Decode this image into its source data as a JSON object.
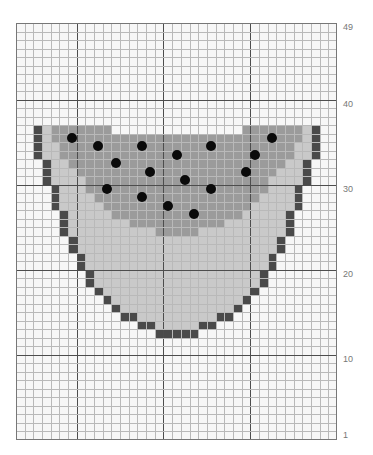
{
  "grid": {
    "columns": 37,
    "rows": 49,
    "major_every_col_offset": 7,
    "major_every": 10,
    "colors": {
      "background": "#f7f7f7",
      "light": "#c9c9c9",
      "medium": "#9b9b9b",
      "dark": "#4a4a4a",
      "dot": "#0a0a0a"
    }
  },
  "row_labels": [
    {
      "row": 49,
      "label": "49"
    },
    {
      "row": 40,
      "label": "40"
    },
    {
      "row": 30,
      "label": "30"
    },
    {
      "row": 20,
      "label": "20"
    },
    {
      "row": 10,
      "label": "10"
    },
    {
      "row": 1,
      "label": "1"
    }
  ],
  "pattern": [
    {
      "row": 37,
      "spans": [
        [
          "dark",
          2,
          2
        ],
        [
          "light",
          3,
          3
        ],
        [
          "medium",
          4,
          10
        ],
        [
          "medium",
          26,
          32
        ],
        [
          "light",
          33,
          33
        ],
        [
          "dark",
          34,
          34
        ]
      ]
    },
    {
      "row": 36,
      "spans": [
        [
          "dark",
          2,
          2
        ],
        [
          "light",
          3,
          3
        ],
        [
          "medium",
          4,
          32
        ],
        [
          "light",
          33,
          33
        ],
        [
          "dark",
          34,
          34
        ]
      ]
    },
    {
      "row": 35,
      "spans": [
        [
          "dark",
          2,
          2
        ],
        [
          "light",
          3,
          4
        ],
        [
          "medium",
          5,
          31
        ],
        [
          "light",
          32,
          33
        ],
        [
          "dark",
          34,
          34
        ]
      ]
    },
    {
      "row": 34,
      "spans": [
        [
          "dark",
          2,
          2
        ],
        [
          "light",
          3,
          4
        ],
        [
          "medium",
          5,
          31
        ],
        [
          "light",
          32,
          33
        ],
        [
          "dark",
          34,
          34
        ]
      ]
    },
    {
      "row": 33,
      "spans": [
        [
          "dark",
          3,
          3
        ],
        [
          "light",
          4,
          5
        ],
        [
          "medium",
          6,
          30
        ],
        [
          "light",
          31,
          32
        ],
        [
          "dark",
          33,
          33
        ]
      ]
    },
    {
      "row": 32,
      "spans": [
        [
          "dark",
          3,
          3
        ],
        [
          "light",
          4,
          6
        ],
        [
          "medium",
          7,
          29
        ],
        [
          "light",
          30,
          32
        ],
        [
          "dark",
          33,
          33
        ]
      ]
    },
    {
      "row": 31,
      "spans": [
        [
          "dark",
          3,
          3
        ],
        [
          "light",
          4,
          7
        ],
        [
          "medium",
          8,
          28
        ],
        [
          "light",
          29,
          32
        ],
        [
          "dark",
          33,
          33
        ]
      ]
    },
    {
      "row": 30,
      "spans": [
        [
          "dark",
          4,
          4
        ],
        [
          "light",
          5,
          7
        ],
        [
          "medium",
          8,
          28
        ],
        [
          "light",
          29,
          31
        ],
        [
          "dark",
          32,
          32
        ]
      ]
    },
    {
      "row": 29,
      "spans": [
        [
          "dark",
          4,
          4
        ],
        [
          "light",
          5,
          8
        ],
        [
          "medium",
          9,
          27
        ],
        [
          "light",
          28,
          31
        ],
        [
          "dark",
          32,
          32
        ]
      ]
    },
    {
      "row": 28,
      "spans": [
        [
          "dark",
          4,
          4
        ],
        [
          "light",
          5,
          9
        ],
        [
          "medium",
          10,
          26
        ],
        [
          "light",
          27,
          31
        ],
        [
          "dark",
          32,
          32
        ]
      ]
    },
    {
      "row": 27,
      "spans": [
        [
          "dark",
          5,
          5
        ],
        [
          "light",
          6,
          10
        ],
        [
          "medium",
          11,
          25
        ],
        [
          "light",
          26,
          30
        ],
        [
          "dark",
          31,
          31
        ]
      ]
    },
    {
      "row": 26,
      "spans": [
        [
          "dark",
          5,
          5
        ],
        [
          "light",
          6,
          12
        ],
        [
          "medium",
          13,
          23
        ],
        [
          "light",
          24,
          30
        ],
        [
          "dark",
          31,
          31
        ]
      ]
    },
    {
      "row": 25,
      "spans": [
        [
          "dark",
          5,
          5
        ],
        [
          "light",
          6,
          15
        ],
        [
          "medium",
          16,
          20
        ],
        [
          "light",
          21,
          30
        ],
        [
          "dark",
          31,
          31
        ]
      ]
    },
    {
      "row": 24,
      "spans": [
        [
          "dark",
          6,
          6
        ],
        [
          "light",
          7,
          29
        ],
        [
          "dark",
          30,
          30
        ]
      ]
    },
    {
      "row": 23,
      "spans": [
        [
          "dark",
          6,
          6
        ],
        [
          "light",
          7,
          29
        ],
        [
          "dark",
          30,
          30
        ]
      ]
    },
    {
      "row": 22,
      "spans": [
        [
          "dark",
          7,
          7
        ],
        [
          "light",
          8,
          28
        ],
        [
          "dark",
          29,
          29
        ]
      ]
    },
    {
      "row": 21,
      "spans": [
        [
          "dark",
          7,
          7
        ],
        [
          "light",
          8,
          28
        ],
        [
          "dark",
          29,
          29
        ]
      ]
    },
    {
      "row": 20,
      "spans": [
        [
          "dark",
          8,
          8
        ],
        [
          "light",
          9,
          27
        ],
        [
          "dark",
          28,
          28
        ]
      ]
    },
    {
      "row": 19,
      "spans": [
        [
          "dark",
          8,
          8
        ],
        [
          "light",
          9,
          27
        ],
        [
          "dark",
          28,
          28
        ]
      ]
    },
    {
      "row": 18,
      "spans": [
        [
          "dark",
          9,
          9
        ],
        [
          "light",
          10,
          26
        ],
        [
          "dark",
          27,
          27
        ]
      ]
    },
    {
      "row": 17,
      "spans": [
        [
          "dark",
          10,
          10
        ],
        [
          "light",
          11,
          25
        ],
        [
          "dark",
          26,
          26
        ]
      ]
    },
    {
      "row": 16,
      "spans": [
        [
          "dark",
          11,
          11
        ],
        [
          "light",
          12,
          24
        ],
        [
          "dark",
          25,
          25
        ]
      ]
    },
    {
      "row": 15,
      "spans": [
        [
          "dark",
          12,
          13
        ],
        [
          "light",
          14,
          22
        ],
        [
          "dark",
          23,
          24
        ]
      ]
    },
    {
      "row": 14,
      "spans": [
        [
          "dark",
          14,
          15
        ],
        [
          "light",
          16,
          20
        ],
        [
          "dark",
          21,
          22
        ]
      ]
    },
    {
      "row": 13,
      "spans": [
        [
          "dark",
          16,
          20
        ]
      ]
    }
  ],
  "seeds": [
    {
      "col": 6,
      "row": 36
    },
    {
      "col": 29,
      "row": 36
    },
    {
      "col": 9,
      "row": 35
    },
    {
      "col": 14,
      "row": 35
    },
    {
      "col": 22,
      "row": 35
    },
    {
      "col": 18,
      "row": 34
    },
    {
      "col": 27,
      "row": 34
    },
    {
      "col": 11,
      "row": 33
    },
    {
      "col": 15,
      "row": 32
    },
    {
      "col": 26,
      "row": 32
    },
    {
      "col": 19,
      "row": 31
    },
    {
      "col": 10,
      "row": 30
    },
    {
      "col": 22,
      "row": 30
    },
    {
      "col": 14,
      "row": 29
    },
    {
      "col": 17,
      "row": 28
    },
    {
      "col": 20,
      "row": 27
    }
  ]
}
